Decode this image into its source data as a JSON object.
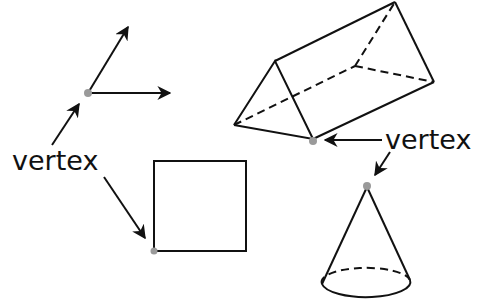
{
  "diagram": {
    "labels": {
      "left": "vertex",
      "right": "vertex"
    },
    "shapes": [
      {
        "name": "angle",
        "vertex": [
          88,
          93
        ]
      },
      {
        "name": "square",
        "vertex": [
          153,
          251
        ]
      },
      {
        "name": "triangular-prism",
        "vertex": [
          313,
          139
        ]
      },
      {
        "name": "cone",
        "vertex": [
          367,
          186
        ]
      }
    ],
    "colors": {
      "stroke": "#111111",
      "vertex_dot": "#9a9a9a",
      "background": "#ffffff"
    }
  }
}
